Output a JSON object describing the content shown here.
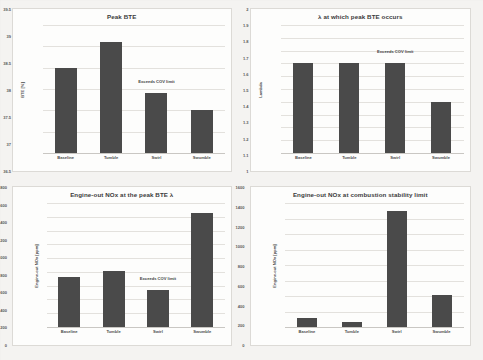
{
  "chart_data": [
    {
      "type": "bar",
      "title": "Peak BTE",
      "xlabel": "",
      "ylabel": "BTE [%]",
      "categories": [
        "Baseline",
        "Tumble",
        "Swirl",
        "Swumble"
      ],
      "values": [
        38.5,
        39.1,
        37.9,
        37.5
      ],
      "ylim": [
        36.5,
        39.5
      ],
      "yticks": [
        "39.5",
        "39",
        "38.5",
        "38",
        "37.5",
        "37",
        "36.5"
      ],
      "ytick_values": [
        39.5,
        39,
        38.5,
        38,
        37.5,
        37,
        36.5
      ],
      "grid": true,
      "legend": "none",
      "annotations": [
        {
          "text": "Exceeds COV limit",
          "category": "Swirl"
        }
      ],
      "bar_color": "#4a4a4a"
    },
    {
      "type": "bar",
      "title": "λ at which peak BTE occurs",
      "xlabel": "",
      "ylabel": "Lambda",
      "categories": [
        "Baseline",
        "Tumble",
        "Swirl",
        "Swumble"
      ],
      "values": [
        1.7,
        1.7,
        1.7,
        1.4
      ],
      "ylim": [
        1,
        2
      ],
      "yticks": [
        "2",
        "1.9",
        "1.8",
        "1.7",
        "1.6",
        "1.5",
        "1.4",
        "1.3",
        "1.2",
        "1.1",
        "1"
      ],
      "ytick_values": [
        2,
        1.9,
        1.8,
        1.7,
        1.6,
        1.5,
        1.4,
        1.3,
        1.2,
        1.1,
        1
      ],
      "grid": true,
      "legend": "none",
      "annotations": [
        {
          "text": "Exceeds COV limit",
          "category": "Swirl"
        }
      ],
      "bar_color": "#4a4a4a"
    },
    {
      "type": "bar",
      "title": "Engine-out NOx at the peak BTE λ",
      "xlabel": "",
      "ylabel": "Engine-out NOx [ppm]",
      "categories": [
        "Baseline",
        "Tumble",
        "Swirl",
        "Swumble"
      ],
      "values": [
        720,
        810,
        540,
        1650
      ],
      "ylim": [
        0,
        1800
      ],
      "yticks": [
        "1800",
        "1600",
        "1400",
        "1200",
        "1000",
        "800",
        "600",
        "400",
        "200",
        "0"
      ],
      "ytick_values": [
        1800,
        1600,
        1400,
        1200,
        1000,
        800,
        600,
        400,
        200,
        0
      ],
      "grid": true,
      "legend": "none",
      "annotations": [
        {
          "text": "Exceeds COV limit",
          "category": "Swirl"
        }
      ],
      "bar_color": "#4a4a4a"
    },
    {
      "type": "bar",
      "title": "Engine-out NOx at combustion stability limit",
      "xlabel": "",
      "ylabel": "Engine-out NOx [ppm]",
      "categories": [
        "Baseline",
        "Tumble",
        "Swirl",
        "Swumble"
      ],
      "values": [
        120,
        70,
        1500,
        410
      ],
      "ylim": [
        0,
        1600
      ],
      "yticks": [
        "1600",
        "1400",
        "1200",
        "1000",
        "800",
        "600",
        "400",
        "200",
        "0"
      ],
      "ytick_values": [
        1600,
        1400,
        1200,
        1000,
        800,
        600,
        400,
        200,
        0
      ],
      "grid": true,
      "legend": "none",
      "annotations": [],
      "bar_color": "#4a4a4a"
    }
  ]
}
